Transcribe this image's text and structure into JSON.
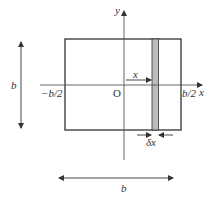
{
  "diagram": {
    "axes": {
      "x_label": "x",
      "y_label": "y",
      "origin_label": "O"
    },
    "ticks": {
      "left": "−b/2",
      "right": "b/2"
    },
    "dimensions": {
      "height_label": "b",
      "width_label": "b"
    },
    "strip": {
      "distance_label": "x",
      "width_label": "δx",
      "fill": "#bbbbbb"
    },
    "colors": {
      "line": "#333333",
      "axis": "#555555",
      "background": "#ffffff"
    }
  }
}
